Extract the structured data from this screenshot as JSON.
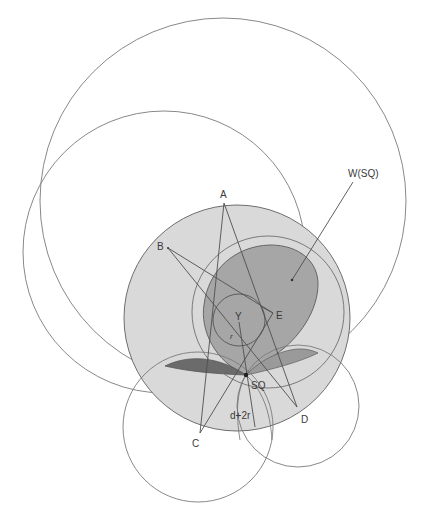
{
  "diagram": {
    "colors": {
      "background": "#ffffff",
      "stroke": "#7a7a7a",
      "line": "#555555",
      "disk_fill": "#d9d9d9",
      "region_fill": "#a6a6a6",
      "lens_dark": "#6b6b6b",
      "lens_medium": "#9a9a9a"
    },
    "labels": {
      "A": "A",
      "B": "B",
      "C": "C",
      "D": "D",
      "E": "E",
      "Y": "Y",
      "r": "r",
      "SQ": "SQ",
      "d2r": "d+2r",
      "W": "W(SQ)"
    },
    "points": {
      "A": [
        224,
        203
      ],
      "B": [
        168,
        248
      ],
      "C": [
        200,
        433
      ],
      "D": [
        297,
        407
      ],
      "E": [
        273,
        313
      ],
      "Y": [
        239,
        321
      ],
      "SQ": [
        246,
        375
      ]
    },
    "circles": [
      {
        "name": "outer-circle-large",
        "cx": 223,
        "cy": 201,
        "r": 183
      },
      {
        "name": "outer-circle-left",
        "cx": 164,
        "cy": 252,
        "r": 141
      },
      {
        "name": "shaded-disk",
        "cx": 237,
        "cy": 318,
        "r": 113
      },
      {
        "name": "inner-medium-circle",
        "cx": 268,
        "cy": 312,
        "r": 76
      },
      {
        "name": "small-circle-y",
        "cx": 239,
        "cy": 320,
        "r": 26
      },
      {
        "name": "bottom-left-circle",
        "cx": 198,
        "cy": 427,
        "r": 75
      },
      {
        "name": "bottom-right-circle",
        "cx": 298,
        "cy": 406,
        "r": 61
      }
    ]
  }
}
